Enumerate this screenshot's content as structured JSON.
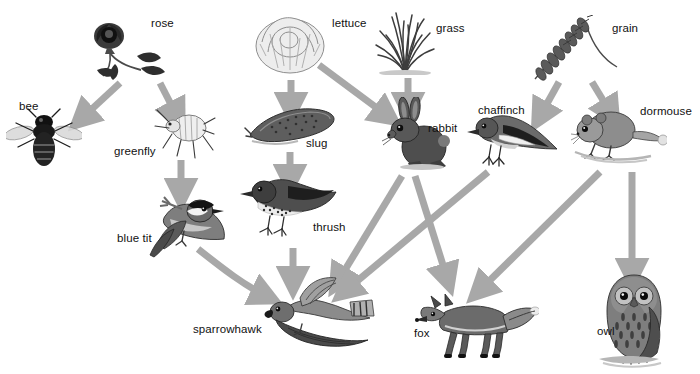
{
  "diagram": {
    "type": "food-web",
    "title": "",
    "background_color": "#ffffff",
    "arrow_color": "#a8a8a8",
    "label_color": "#111111",
    "organisms": [
      {
        "id": "rose",
        "label": "rose",
        "kind": "plant",
        "trophic": "producer",
        "x": 130,
        "y": 52,
        "label_x": 151,
        "label_y": 17
      },
      {
        "id": "lettuce",
        "label": "lettuce",
        "kind": "plant",
        "trophic": "producer",
        "x": 290,
        "y": 44,
        "label_x": 332,
        "label_y": 17
      },
      {
        "id": "grass",
        "label": "grass",
        "kind": "plant",
        "trophic": "producer",
        "x": 405,
        "y": 45,
        "label_x": 436,
        "label_y": 22
      },
      {
        "id": "grain",
        "label": "grain",
        "kind": "plant",
        "trophic": "producer",
        "x": 573,
        "y": 47,
        "label_x": 612,
        "label_y": 22
      },
      {
        "id": "bee",
        "label": "bee",
        "kind": "insect",
        "trophic": "primary-consumer",
        "x": 44,
        "y": 135,
        "label_x": 19,
        "label_y": 100
      },
      {
        "id": "greenfly",
        "label": "greenfly",
        "kind": "insect",
        "trophic": "primary-consumer",
        "x": 179,
        "y": 130,
        "label_x": 114,
        "label_y": 145
      },
      {
        "id": "slug",
        "label": "slug",
        "kind": "mollusc",
        "trophic": "primary-consumer",
        "x": 288,
        "y": 125,
        "label_x": 306,
        "label_y": 137
      },
      {
        "id": "rabbit",
        "label": "rabbit",
        "kind": "mammal",
        "trophic": "primary-consumer",
        "x": 408,
        "y": 135,
        "label_x": 428,
        "label_y": 122
      },
      {
        "id": "chaffinch",
        "label": "chaffinch",
        "kind": "bird",
        "trophic": "primary-consumer",
        "x": 511,
        "y": 135,
        "label_x": 478,
        "label_y": 104
      },
      {
        "id": "dormouse",
        "label": "dormouse",
        "kind": "mammal",
        "trophic": "primary-consumer",
        "x": 613,
        "y": 132,
        "label_x": 640,
        "label_y": 105
      },
      {
        "id": "blue tit",
        "label": "blue tit",
        "kind": "bird",
        "trophic": "secondary-consumer",
        "x": 172,
        "y": 223,
        "label_x": 117,
        "label_y": 232
      },
      {
        "id": "thrush",
        "label": "thrush",
        "kind": "bird",
        "trophic": "secondary-consumer",
        "x": 280,
        "y": 200,
        "label_x": 313,
        "label_y": 221
      },
      {
        "id": "sparrowhawk",
        "label": "sparrowhawk",
        "kind": "bird",
        "trophic": "tertiary-consumer",
        "x": 300,
        "y": 310,
        "label_x": 193,
        "label_y": 323
      },
      {
        "id": "fox",
        "label": "fox",
        "kind": "mammal",
        "trophic": "tertiary-consumer",
        "x": 465,
        "y": 320,
        "label_x": 414,
        "label_y": 327
      },
      {
        "id": "owl",
        "label": "owl",
        "kind": "bird",
        "trophic": "tertiary-consumer",
        "x": 631,
        "y": 315,
        "label_x": 597,
        "label_y": 325
      }
    ],
    "links": [
      {
        "from": "rose",
        "to": "bee",
        "style": "straight"
      },
      {
        "from": "rose",
        "to": "greenfly",
        "style": "straight"
      },
      {
        "from": "greenfly",
        "to": "blue tit",
        "style": "straight"
      },
      {
        "from": "lettuce",
        "to": "slug",
        "style": "straight"
      },
      {
        "from": "lettuce",
        "to": "rabbit",
        "style": "straight"
      },
      {
        "from": "slug",
        "to": "thrush",
        "style": "straight"
      },
      {
        "from": "grass",
        "to": "rabbit",
        "style": "straight"
      },
      {
        "from": "grain",
        "to": "chaffinch",
        "style": "straight"
      },
      {
        "from": "grain",
        "to": "dormouse",
        "style": "straight"
      },
      {
        "from": "thrush",
        "to": "sparrowhawk",
        "style": "straight"
      },
      {
        "from": "blue tit",
        "to": "sparrowhawk",
        "style": "curved"
      },
      {
        "from": "rabbit",
        "to": "sparrowhawk",
        "style": "straight"
      },
      {
        "from": "rabbit",
        "to": "fox",
        "style": "straight"
      },
      {
        "from": "chaffinch",
        "to": "sparrowhawk",
        "style": "straight"
      },
      {
        "from": "dormouse",
        "to": "fox",
        "style": "straight"
      },
      {
        "from": "dormouse",
        "to": "owl",
        "style": "straight"
      }
    ]
  }
}
